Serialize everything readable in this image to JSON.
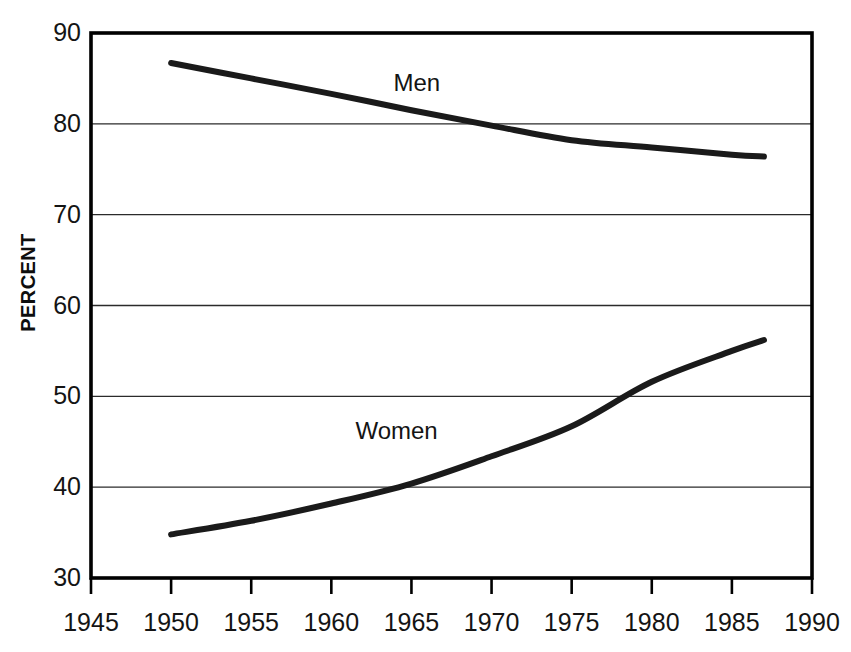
{
  "chart_data": {
    "type": "line",
    "title": "",
    "subtitle": "",
    "xlabel": "",
    "ylabel": "PERCENT",
    "xlim": [
      1945,
      1990
    ],
    "ylim": [
      30,
      90
    ],
    "xticks": [
      1945,
      1950,
      1955,
      1960,
      1965,
      1970,
      1975,
      1980,
      1985,
      1990
    ],
    "yticks": [
      30,
      40,
      50,
      60,
      70,
      80,
      90
    ],
    "grid": "horizontal",
    "legend_position": "inline-annotations",
    "annotations": [
      {
        "text": "Men",
        "x": 1965.5,
        "y": 84.5
      },
      {
        "text": "Women",
        "x": 1964.0,
        "y": 46.2
      }
    ],
    "series": [
      {
        "name": "Men",
        "color": "#1a1a1a",
        "x": [
          1950,
          1955,
          1960,
          1965,
          1970,
          1975,
          1980,
          1985,
          1987
        ],
        "values": [
          86.7,
          85.0,
          83.3,
          81.5,
          79.8,
          78.2,
          77.4,
          76.6,
          76.4
        ]
      },
      {
        "name": "Women",
        "color": "#1a1a1a",
        "x": [
          1950,
          1955,
          1960,
          1965,
          1970,
          1975,
          1980,
          1985,
          1987
        ],
        "values": [
          34.8,
          36.3,
          38.2,
          40.4,
          43.4,
          46.7,
          51.6,
          55.0,
          56.2
        ]
      }
    ]
  },
  "axes": {
    "y_tick_labels": [
      "90",
      "80",
      "70",
      "60",
      "50",
      "40",
      "30"
    ],
    "x_tick_labels": [
      "1945",
      "1950",
      "1955",
      "1960",
      "1965",
      "1970",
      "1975",
      "1980",
      "1985",
      "1990"
    ],
    "y_axis_title": "PERCENT"
  },
  "labels": {
    "men": "Men",
    "women": "Women"
  },
  "colors": {
    "line": "#1a1a1a",
    "frame": "#000000",
    "gridline": "#2b2b2b",
    "background": "#ffffff"
  }
}
